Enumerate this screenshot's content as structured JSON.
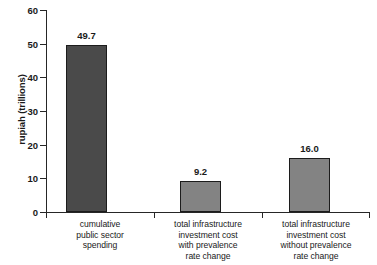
{
  "chart_data": {
    "type": "bar",
    "title": "",
    "xlabel": "",
    "ylabel": "rupiah (trillions)",
    "ylim": [
      0,
      60
    ],
    "ytick_labels": [
      "0",
      "10",
      "20",
      "30",
      "40",
      "50",
      "60"
    ],
    "ytick_values": [
      0,
      10,
      20,
      30,
      40,
      50,
      60
    ],
    "grid": false,
    "legend": null,
    "categories": [
      "cumulative public sector spending",
      "total infrastructure investment cost with prevalence rate change",
      "total infrastructure investment cost without prevalence rate change"
    ],
    "category_lines": [
      [
        "cumulative",
        "public sector",
        "spending"
      ],
      [
        "total infrastructure",
        "investment cost",
        "with prevalence",
        "rate change"
      ],
      [
        "total infrastructure",
        "investment cost",
        "without prevalence",
        "rate change"
      ]
    ],
    "values": [
      49.7,
      9.2,
      16.0
    ],
    "value_labels": [
      "49.7",
      "9.2",
      "16.0"
    ],
    "bar_colors": [
      "#4a4a4a",
      "#838383",
      "#838383"
    ],
    "bar_edge_color": "#1c1c1c",
    "axis_color": "#262626",
    "background_color": "#ffffff"
  }
}
